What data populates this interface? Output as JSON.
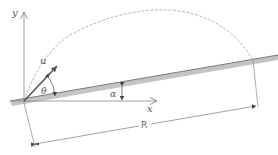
{
  "figure": {
    "type": "projectile-on-inclined-plane",
    "labels": {
      "y_axis": "y",
      "x_axis": "x",
      "velocity": "u",
      "launch_angle": "θ",
      "incline_angle": "α",
      "range": "R"
    },
    "colors": {
      "line": "#777777",
      "plane_fill": "#bdbdbd",
      "plane_edge": "#8a8a8a",
      "trajectory": "#9a9a9a",
      "text": "#555555"
    }
  }
}
